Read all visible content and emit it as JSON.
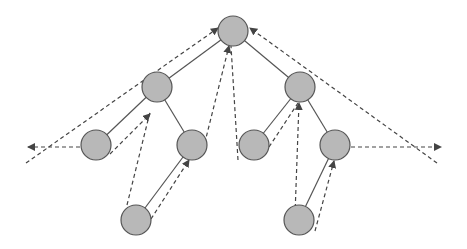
{
  "diagram": {
    "type": "binary-tree-traversal",
    "colors": {
      "node_fill": "#b8b8b8",
      "node_stroke": "#555555",
      "edge": "#555555",
      "dashed": "#444444",
      "background": "#ffffff"
    },
    "node_radius": 15,
    "nodes": [
      {
        "id": "root",
        "x": 233,
        "y": 31
      },
      {
        "id": "L",
        "x": 157,
        "y": 87
      },
      {
        "id": "R",
        "x": 300,
        "y": 87
      },
      {
        "id": "LL",
        "x": 96,
        "y": 145
      },
      {
        "id": "LR",
        "x": 192,
        "y": 145
      },
      {
        "id": "RL",
        "x": 254,
        "y": 145
      },
      {
        "id": "RR",
        "x": 335,
        "y": 145
      },
      {
        "id": "LRL",
        "x": 136,
        "y": 220
      },
      {
        "id": "RRL",
        "x": 299,
        "y": 220
      }
    ],
    "edges": [
      {
        "from": "root",
        "to": "L"
      },
      {
        "from": "root",
        "to": "R"
      },
      {
        "from": "L",
        "to": "LL"
      },
      {
        "from": "L",
        "to": "LR"
      },
      {
        "from": "R",
        "to": "RL"
      },
      {
        "from": "R",
        "to": "RR"
      },
      {
        "from": "LR",
        "to": "LRL"
      },
      {
        "from": "RR",
        "to": "RRL"
      }
    ],
    "dashed_arrows": [
      {
        "x1": 26,
        "y1": 163,
        "x2": 218,
        "y2": 28,
        "arrow": true
      },
      {
        "x1": 80,
        "y1": 147,
        "x2": 28,
        "y2": 147,
        "arrow": true
      },
      {
        "x1": 110,
        "y1": 154,
        "x2": 150,
        "y2": 114,
        "arrow": true
      },
      {
        "x1": 127,
        "y1": 205,
        "x2": 150,
        "y2": 112,
        "arrow": false
      },
      {
        "x1": 151,
        "y1": 219,
        "x2": 189,
        "y2": 160,
        "arrow": true
      },
      {
        "x1": 203,
        "y1": 150,
        "x2": 229,
        "y2": 46,
        "arrow": true
      },
      {
        "x1": 238,
        "y1": 160,
        "x2": 231,
        "y2": 46,
        "arrow": false
      },
      {
        "x1": 269,
        "y1": 147,
        "x2": 298,
        "y2": 103,
        "arrow": false
      },
      {
        "x1": 295,
        "y1": 215,
        "x2": 299,
        "y2": 103,
        "arrow": true
      },
      {
        "x1": 315,
        "y1": 231,
        "x2": 334,
        "y2": 161,
        "arrow": true
      },
      {
        "x1": 351,
        "y1": 147,
        "x2": 441,
        "y2": 147,
        "arrow": true
      },
      {
        "x1": 437,
        "y1": 163,
        "x2": 250,
        "y2": 28,
        "arrow": true
      }
    ]
  }
}
